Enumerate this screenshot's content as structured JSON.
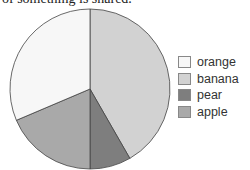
{
  "caption": "of something is shared.",
  "chart_data": {
    "type": "pie",
    "title": "",
    "categories": [
      "orange",
      "banana",
      "pear",
      "apple"
    ],
    "values": [
      31.4,
      41.7,
      8.3,
      18.6
    ],
    "colors": [
      "#f7f7f7",
      "#d2d2d2",
      "#7e7e7e",
      "#a9a9a9"
    ],
    "start_angle_deg": 0,
    "direction": "clockwise",
    "draw_order": [
      "banana",
      "pear",
      "apple",
      "orange"
    ],
    "legend_position": "right"
  },
  "legend": [
    {
      "label": "orange",
      "color": "#f7f7f7"
    },
    {
      "label": "banana",
      "color": "#d2d2d2"
    },
    {
      "label": "pear",
      "color": "#7e7e7e"
    },
    {
      "label": "apple",
      "color": "#a9a9a9"
    }
  ]
}
